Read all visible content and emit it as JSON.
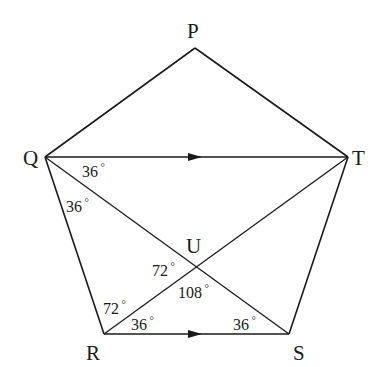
{
  "diagram": {
    "type": "geometry",
    "shape": "pentagon",
    "vertices": [
      {
        "name": "P",
        "x": 195,
        "y": 48,
        "label_x": 187,
        "label_y": 38
      },
      {
        "name": "Q",
        "x": 45,
        "y": 157,
        "label_x": 23,
        "label_y": 165
      },
      {
        "name": "R",
        "x": 104,
        "y": 334,
        "label_x": 86,
        "label_y": 360
      },
      {
        "name": "S",
        "x": 289,
        "y": 334,
        "label_x": 293,
        "label_y": 360
      },
      {
        "name": "T",
        "x": 348,
        "y": 157,
        "label_x": 352,
        "label_y": 165
      }
    ],
    "intersection": {
      "name": "U",
      "x": 196,
      "y": 267,
      "label_x": 186,
      "label_y": 253
    },
    "edges": [
      {
        "from": "P",
        "to": "Q"
      },
      {
        "from": "P",
        "to": "T"
      },
      {
        "from": "Q",
        "to": "R"
      },
      {
        "from": "R",
        "to": "S"
      },
      {
        "from": "S",
        "to": "T"
      }
    ],
    "diagonals": [
      {
        "from": "Q",
        "to": "T",
        "arrow": true
      },
      {
        "from": "Q",
        "to": "S",
        "arrow": false
      },
      {
        "from": "R",
        "to": "T",
        "arrow": false
      }
    ],
    "parallel_marks": [
      {
        "segment": "QT",
        "x": 195,
        "y": 157
      },
      {
        "segment": "RS",
        "x": 195,
        "y": 334
      }
    ],
    "angles": [
      {
        "label": "36",
        "unit": "°",
        "at": "Q",
        "between": "QT-QS",
        "x": 82,
        "y": 177
      },
      {
        "label": "36",
        "unit": "°",
        "at": "Q",
        "between": "QS-QR",
        "x": 66,
        "y": 212
      },
      {
        "label": "72",
        "unit": "°",
        "at": "U",
        "between": "UR-UQ",
        "x": 152,
        "y": 276
      },
      {
        "label": "108",
        "unit": "°",
        "at": "U",
        "between": "UR-US",
        "x": 178,
        "y": 298
      },
      {
        "label": "72",
        "unit": "°",
        "at": "R",
        "between": "RQ-RT",
        "x": 103,
        "y": 314
      },
      {
        "label": "36",
        "unit": "°",
        "at": "R",
        "between": "RT-RS",
        "x": 131,
        "y": 330
      },
      {
        "label": "36",
        "unit": "°",
        "at": "S",
        "between": "SR-SQ",
        "x": 233,
        "y": 330
      }
    ]
  }
}
